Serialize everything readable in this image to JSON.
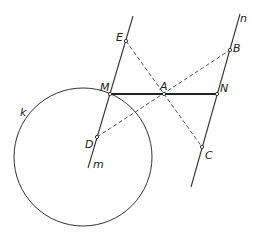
{
  "diagram": {
    "colors": {
      "stroke": "#333333",
      "background": "#ffffff"
    },
    "circle": {
      "label": "k",
      "cx": 83,
      "cy": 157,
      "r": 69
    },
    "lines": [
      {
        "label": "m",
        "x1": 133,
        "y1": 16,
        "x2": 88,
        "y2": 168
      },
      {
        "label": "n",
        "x1": 240,
        "y1": 14,
        "x2": 191,
        "y2": 187
      }
    ],
    "points": {
      "E": {
        "label": "E",
        "x": 126,
        "y": 41
      },
      "M": {
        "label": "M",
        "x": 110,
        "y": 94
      },
      "D": {
        "label": "D",
        "x": 97,
        "y": 137
      },
      "A": {
        "label": "A",
        "x": 164,
        "y": 94
      },
      "N": {
        "label": "N",
        "x": 217,
        "y": 94
      },
      "B": {
        "label": "B",
        "x": 230,
        "y": 50
      },
      "C": {
        "label": "C",
        "x": 202,
        "y": 147
      }
    },
    "segments": {
      "solid_bold": [
        "M-N"
      ],
      "dashed": [
        "E-C",
        "D-B"
      ]
    },
    "labels": {
      "k": "k",
      "m": "m",
      "n": "n",
      "E": "E",
      "M": "M",
      "D": "D",
      "A": "A",
      "N": "N",
      "B": "B",
      "C": "C"
    }
  }
}
